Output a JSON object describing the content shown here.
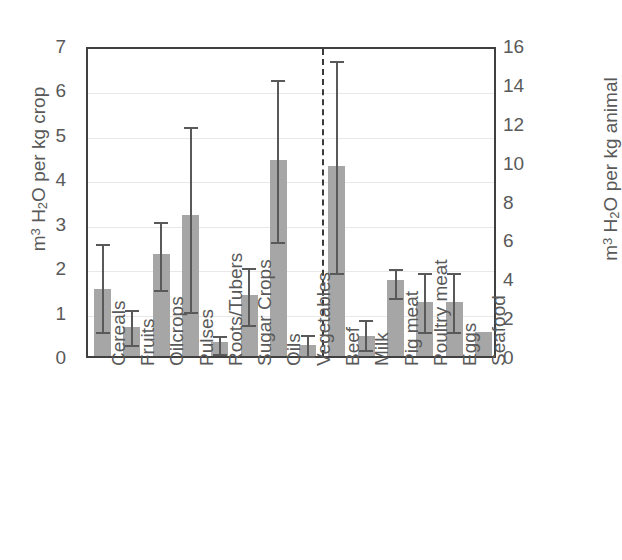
{
  "chart_data": {
    "type": "bar",
    "title": "",
    "subtitle": "",
    "xlabel": "",
    "ylabel_left": "m3 H2O per kg crop",
    "ylabel_right": "m3 H2O per kg animal",
    "ylim_left": [
      0,
      7
    ],
    "ylim_right": [
      0,
      16
    ],
    "yticks_left": [
      "7",
      "6",
      "5",
      "4",
      "3",
      "2",
      "1",
      "0"
    ],
    "yticks_right": [
      "16",
      "14",
      "12",
      "10",
      "8",
      "6",
      "4",
      "2",
      "0"
    ],
    "grid": true,
    "legend": "none",
    "annotations": [
      "dashed vertical divider separating crop products (left axis) from animal products (right axis)"
    ],
    "categories": [
      "Cereals",
      "Fruits",
      "Oilcrops",
      "Pulses",
      "Roots/Tubers",
      "Sugar Crops",
      "Oils",
      "Vegetables",
      "Beef",
      "Milk",
      "Pig meat",
      "Poultry meat",
      "Eggs",
      "Seafood"
    ],
    "groups": [
      {
        "name": "crops",
        "axis": "left",
        "categories": [
          "Cereals",
          "Fruits",
          "Oilcrops",
          "Pulses",
          "Roots/Tubers",
          "Sugar Crops",
          "Oils",
          "Vegetables"
        ]
      },
      {
        "name": "animal",
        "axis": "right",
        "categories": [
          "Beef",
          "Milk",
          "Pig meat",
          "Poultry meat",
          "Eggs",
          "Seafood"
        ]
      }
    ],
    "bars": [
      {
        "label": "Cereals",
        "axis": "left",
        "value": 1.5,
        "err_low": 0.63,
        "err_high": 2.6
      },
      {
        "label": "Fruits",
        "axis": "left",
        "value": 0.65,
        "err_low": 0.34,
        "err_high": 1.13
      },
      {
        "label": "Oilcrops",
        "axis": "left",
        "value": 2.3,
        "err_low": 1.58,
        "err_high": 3.1
      },
      {
        "label": "Pulses",
        "axis": "left",
        "value": 3.17,
        "err_low": 1.08,
        "err_high": 5.25
      },
      {
        "label": "Roots/Tubers",
        "axis": "left",
        "value": 0.31,
        "err_low": 0.13,
        "err_high": 0.54
      },
      {
        "label": "Sugar Crops",
        "axis": "left",
        "value": 1.37,
        "err_low": 0.79,
        "err_high": 2.07
      },
      {
        "label": "Oils",
        "axis": "left",
        "value": 4.41,
        "err_low": 2.66,
        "err_high": 6.3
      },
      {
        "label": "Vegetables",
        "axis": "left",
        "value": 0.24,
        "err_low": 0.1,
        "err_high": 0.56
      },
      {
        "label": "Beef",
        "axis": "right",
        "value": 9.8,
        "err_low": 4.5,
        "err_high": 15.4
      },
      {
        "label": "Milk",
        "axis": "right",
        "value": 1.05,
        "err_low": 0.5,
        "err_high": 2.05
      },
      {
        "label": "Pig meat",
        "axis": "right",
        "value": 3.9,
        "err_low": 3.2,
        "err_high": 4.7
      },
      {
        "label": "Poultry meat",
        "axis": "right",
        "value": 2.8,
        "err_low": 1.45,
        "err_high": 4.5
      },
      {
        "label": "Eggs",
        "axis": "right",
        "value": 2.8,
        "err_low": 1.45,
        "err_high": 4.5
      },
      {
        "label": "Seafood",
        "axis": "right",
        "value": 1.22,
        "err_low": null,
        "err_high": null
      }
    ],
    "colors": {
      "bar_fill": "#a6a6a6",
      "error_bar": "#595959",
      "axis": "#404040",
      "gridline": "#e8e8e8",
      "text": "#595959",
      "divider": "#3a3a3a"
    }
  }
}
